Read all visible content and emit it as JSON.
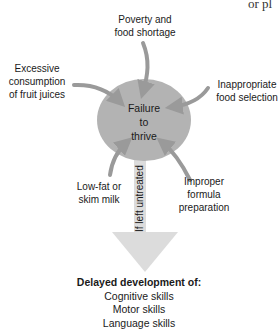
{
  "corner_text": "or pl",
  "center": {
    "lines": [
      "Failure",
      "to",
      "thrive"
    ]
  },
  "causes": [
    {
      "id": "poverty",
      "lines": [
        "Poverty and",
        "food shortage"
      ]
    },
    {
      "id": "fruit_juice",
      "lines": [
        "Excessive",
        "consumption",
        "of fruit juices"
      ]
    },
    {
      "id": "food_selection",
      "lines": [
        "Inappropriate",
        "food selection"
      ]
    },
    {
      "id": "low_fat_milk",
      "lines": [
        "Low-fat or",
        "skim milk"
      ]
    },
    {
      "id": "formula",
      "lines": [
        "Improper",
        "formula",
        "preparation"
      ]
    }
  ],
  "arrow_label": "If left untreated",
  "outcome": {
    "heading": "Delayed development of:",
    "items": [
      "Cognitive skills",
      "Motor skills",
      "Language skills"
    ]
  },
  "colors": {
    "circle": "#b3b3b3",
    "arrows": "#9a9a9a",
    "down_arrow": "#dcdcdc",
    "text": "#1a1a1a"
  }
}
